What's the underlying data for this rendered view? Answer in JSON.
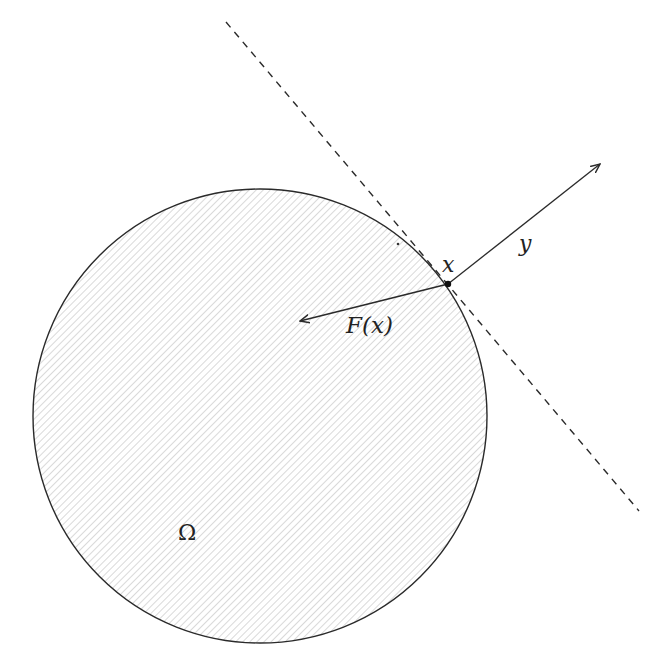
{
  "diagram": {
    "colors": {
      "stroke": "#2a2a2a",
      "hatch": "#c8c8c8",
      "background": "#ffffff"
    },
    "region": {
      "label": "Ω",
      "shape": "circle",
      "center": [
        260,
        416
      ],
      "radius": 227,
      "fill": "hatched-45deg"
    },
    "point": {
      "label": "x",
      "position": [
        448,
        284
      ]
    },
    "tangent_line": {
      "style": "dashed",
      "from": [
        226,
        22
      ],
      "to": [
        639,
        511
      ]
    },
    "vectors": [
      {
        "label": "y",
        "from": [
          448,
          284
        ],
        "to": [
          600,
          164
        ]
      },
      {
        "label": "F(x)",
        "from": [
          448,
          284
        ],
        "to": [
          300,
          321
        ]
      }
    ],
    "labels": {
      "omega": "Ω",
      "x": "x",
      "y": "y",
      "fx": "F(x)"
    }
  }
}
